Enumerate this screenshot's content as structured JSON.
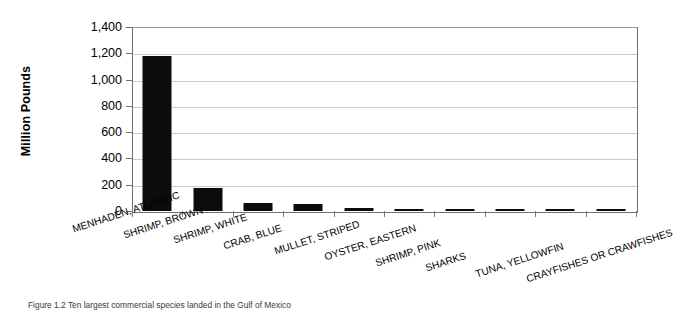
{
  "chart_data": {
    "type": "bar",
    "title": "",
    "xlabel": "",
    "ylabel": "Million Pounds",
    "ylim": [
      0,
      1400
    ],
    "ytick_labels": [
      "0",
      "200",
      "400",
      "600",
      "800",
      "1,000",
      "1,200",
      "1,400"
    ],
    "ytick_values": [
      0,
      200,
      400,
      600,
      800,
      1000,
      1200,
      1400
    ],
    "grid": true,
    "legend": "none",
    "bar_color": "#0c0c0c",
    "categories": [
      "MENHADEN, ATLANTIC",
      "SHRIMP, BROWN",
      "SHRIMP, WHITE",
      "CRAB, BLUE",
      "MULLET, STRIPED",
      "OYSTER, EASTERN",
      "SHRIMP, PINK",
      "SHARKS",
      "TUNA, YELLOWFIN",
      "CRAYFISHES OR CRAWFISHES"
    ],
    "values": [
      1180,
      175,
      62,
      50,
      25,
      13,
      11,
      9,
      7,
      6
    ]
  },
  "caption": {
    "text": "Figure 1.2  Ten largest commercial species landed in the Gulf of Mexico"
  }
}
